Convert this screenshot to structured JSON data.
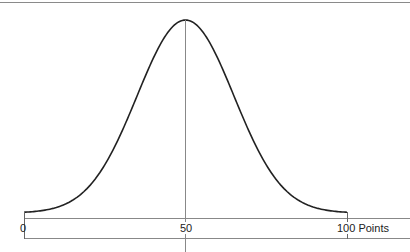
{
  "chart_data": {
    "type": "line",
    "title": "",
    "xlabel": "Points",
    "ylabel": "",
    "x_ticks": [
      "0",
      "50",
      "100"
    ],
    "xlim": [
      0,
      100
    ],
    "mean": 50,
    "std_dev_estimate": 15,
    "grid": false,
    "legend": null,
    "series": [
      {
        "name": "normal distribution",
        "x": [
          0,
          10,
          20,
          30,
          40,
          50,
          60,
          70,
          80,
          90,
          100
        ],
        "values": [
          0.004,
          0.03,
          0.14,
          0.41,
          0.8,
          1.0,
          0.8,
          0.41,
          0.14,
          0.03,
          0.004
        ]
      }
    ]
  },
  "axis": {
    "label_min": "0",
    "label_mid": "50",
    "label_max": "100 Points"
  },
  "colors": {
    "curve": "#222222",
    "axis": "#777777",
    "center_line": "#888888"
  }
}
